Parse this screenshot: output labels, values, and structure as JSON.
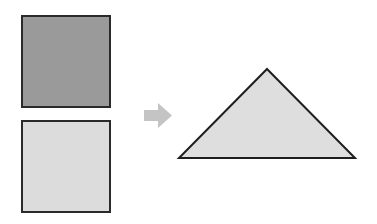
{
  "diagram": {
    "shapes": {
      "square_top": {
        "fill": "#9a9a9a",
        "stroke": "#2a2a2a"
      },
      "square_bottom": {
        "fill": "#dcdcdc",
        "stroke": "#2a2a2a"
      },
      "arrow": {
        "fill": "#c4c4c4",
        "direction": "right"
      },
      "triangle": {
        "fill": "#dedede",
        "stroke": "#1e1e1e"
      }
    }
  }
}
